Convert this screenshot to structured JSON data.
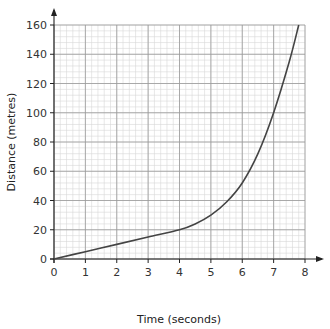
{
  "chart_data": {
    "type": "line",
    "title": "",
    "xlabel": "Time (seconds)",
    "ylabel": "Distance (metres)",
    "xlim": [
      0,
      8
    ],
    "ylim": [
      0,
      160
    ],
    "x_ticks": [
      0,
      1,
      2,
      3,
      4,
      5,
      6,
      7,
      8
    ],
    "y_ticks": [
      0,
      20,
      40,
      60,
      80,
      100,
      120,
      140,
      160
    ],
    "grid": {
      "on": true,
      "major_x": 1,
      "minor_x": 0.2,
      "major_y": 20,
      "minor_y": 4
    },
    "legend": null,
    "series": [
      {
        "name": "distance-time",
        "x": [
          0,
          1,
          2,
          3,
          4,
          4.5,
          5,
          5.5,
          6,
          6.5,
          7,
          7.5,
          7.8
        ],
        "y": [
          0,
          5,
          10,
          15,
          20,
          24,
          30,
          39,
          52,
          72,
          100,
          135,
          160
        ]
      }
    ],
    "colors": {
      "line": "#444444",
      "grid_major": "#999999",
      "grid_minor": "#d6d6d6",
      "axis": "#222222"
    }
  },
  "labels": {
    "xlabel": "Time (seconds)",
    "ylabel": "Distance (metres)"
  }
}
